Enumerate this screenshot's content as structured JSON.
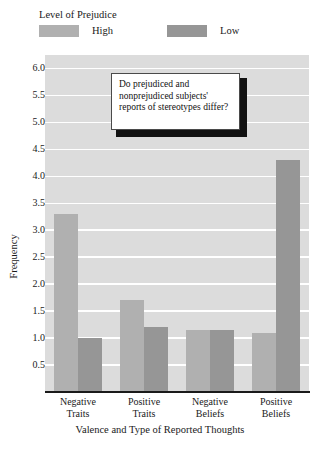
{
  "legend": {
    "title": "Level of Prejudice",
    "items": [
      {
        "label": "High",
        "color": "#b0b0b0"
      },
      {
        "label": "Low",
        "color": "#969696"
      }
    ]
  },
  "callout": {
    "text": "Do prejudiced and nonprejudiced subjects' reports of stereotypes differ?"
  },
  "chart_data": {
    "type": "bar",
    "title": "",
    "xlabel": "Valence and Type of Reported Thoughts",
    "ylabel": "Frequency",
    "categories": [
      "Negative Traits",
      "Positive Traits",
      "Negative Beliefs",
      "Positive Beliefs"
    ],
    "category_lines": [
      [
        "Negative",
        "Traits"
      ],
      [
        "Positive",
        "Traits"
      ],
      [
        "Negative",
        "Beliefs"
      ],
      [
        "Positive",
        "Beliefs"
      ]
    ],
    "series": [
      {
        "name": "High",
        "color": "#b0b0b0",
        "values": [
          3.3,
          1.7,
          1.15,
          1.1
        ]
      },
      {
        "name": "Low",
        "color": "#969696",
        "values": [
          1.0,
          1.2,
          1.15,
          4.3
        ]
      }
    ],
    "ylim": [
      0,
      6.25
    ],
    "yticks": [
      0.5,
      1.0,
      1.5,
      2.0,
      2.5,
      3.0,
      3.5,
      4.0,
      4.5,
      5.0,
      5.5,
      6.0
    ],
    "ytick_labels": [
      "0.5",
      "1.0",
      "1.5",
      "2.0",
      "2.5",
      "3.0",
      "3.5",
      "4.0",
      "4.5",
      "5.0",
      "5.5",
      "6.0"
    ],
    "grid": true,
    "grid_color": "#ffffff",
    "plot_background": "#dcdcdc",
    "legend_position": "top"
  }
}
